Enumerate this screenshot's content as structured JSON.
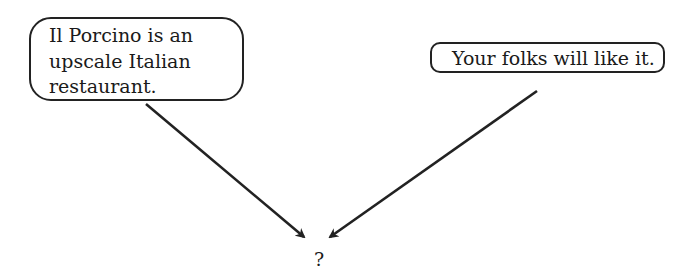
{
  "diagram": {
    "left_statement": {
      "lines": [
        "Il Porcino is an",
        "upscale Italian",
        "restaurant."
      ],
      "text": "Il Porcino is an upscale Italian restaurant."
    },
    "right_statement": {
      "text": "Your folks will like it."
    },
    "conclusion": {
      "text": "?"
    },
    "arrows": [
      {
        "from": "left_statement",
        "to": "conclusion"
      },
      {
        "from": "right_statement",
        "to": "conclusion"
      }
    ],
    "colors": {
      "stroke": "#222222",
      "background": "#ffffff",
      "text": "#1a1a1a"
    }
  }
}
